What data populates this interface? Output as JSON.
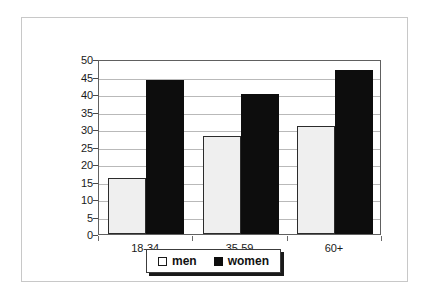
{
  "chart_data": {
    "type": "bar",
    "title": "",
    "subtitle": "",
    "xlabel": "",
    "ylabel": "",
    "categories": [
      "18-34",
      "35-59",
      "60+"
    ],
    "series": [
      {
        "name": "men",
        "values": [
          16,
          28,
          31
        ],
        "color": "#efefef"
      },
      {
        "name": "women",
        "values": [
          44,
          40,
          47
        ],
        "color": "#0d0d0d"
      }
    ],
    "ylim": [
      0,
      50
    ],
    "ytick_step": 5,
    "yticks": [
      50,
      45,
      40,
      35,
      30,
      25,
      20,
      15,
      10,
      5,
      0
    ],
    "grid": true,
    "grid_axis": "y",
    "legend_position": "bottom"
  },
  "legend": {
    "entries": [
      {
        "label": "men",
        "swatch": "men"
      },
      {
        "label": "women",
        "swatch": "women"
      }
    ]
  },
  "colors": {
    "men_fill": "#efefef",
    "men_outline": "#2b2b2b",
    "women_fill": "#0d0d0d",
    "gridline": "#b9b9b9",
    "axis": "#606060",
    "frame": "#c8c8c8",
    "text": "#1a1a1a"
  }
}
